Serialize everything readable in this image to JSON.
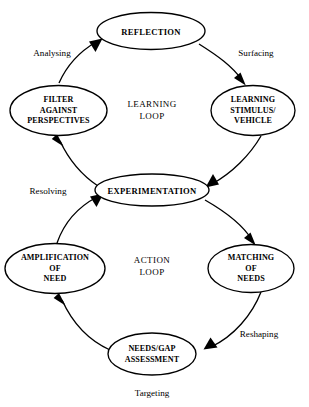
{
  "figure": {
    "name": "double-loop-learning-action-diagram",
    "background_color": "#ffffff",
    "stroke_color": "#000000",
    "width": 309,
    "height": 407
  },
  "loops": {
    "learning": {
      "label_line1": "LEARNING",
      "label_line2": "LOOP"
    },
    "action": {
      "label_line1": "ACTION",
      "label_line2": "LOOP"
    }
  },
  "nodes": {
    "reflection": {
      "lines": [
        "REFLECTION"
      ]
    },
    "learning_stimulus": {
      "lines": [
        "LEARNING",
        "STIMULUS/",
        "VEHICLE"
      ]
    },
    "experimentation": {
      "lines": [
        "EXPERIMENTATION"
      ]
    },
    "filter_against_perspectives": {
      "lines": [
        "FILTER",
        "AGAINST",
        "PERSPECTIVES"
      ]
    },
    "matching_of_needs": {
      "lines": [
        "MATCHING",
        "OF",
        "NEEDS"
      ]
    },
    "needs_gap_assessment": {
      "lines": [
        "NEEDS/GAP",
        "ASSESSMENT"
      ]
    },
    "amplification_of_need": {
      "lines": [
        "AMPLIFICATION",
        "OF",
        "NEED"
      ]
    }
  },
  "edge_labels": {
    "analysing": "Analysing",
    "surfacing": "Surfacing",
    "resolving": "Resolving",
    "reshaping": "Reshaping",
    "targeting": "Targeting"
  }
}
